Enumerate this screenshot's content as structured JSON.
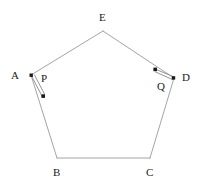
{
  "figure": {
    "type": "geometry-diagram",
    "shape_name": "pentagon",
    "canvas": {
      "width": 203,
      "height": 188
    },
    "style": {
      "edge_color": "#9a9a9a",
      "edge_width": 0.9,
      "vector_color": "#5a5a5a",
      "dot_color": "#1a1a1a",
      "label_color": "#1a1a1a",
      "background": "#ffffff"
    },
    "vertices": [
      {
        "id": "A",
        "label": "A",
        "x": 31,
        "y": 75,
        "label_x": 11,
        "label_y": 70,
        "has_dot": true
      },
      {
        "id": "B",
        "label": "B",
        "x": 57,
        "y": 158,
        "label_x": 53,
        "label_y": 167,
        "has_dot": false
      },
      {
        "id": "C",
        "label": "C",
        "x": 150,
        "y": 158,
        "label_x": 146,
        "label_y": 167,
        "has_dot": false
      },
      {
        "id": "D",
        "label": "D",
        "x": 174,
        "y": 78,
        "label_x": 182,
        "label_y": 72,
        "has_dot": true
      },
      {
        "id": "E",
        "label": "E",
        "x": 103,
        "y": 31,
        "label_x": 99,
        "label_y": 12,
        "has_dot": false
      }
    ],
    "edges": [
      {
        "from": "A",
        "to": "E"
      },
      {
        "from": "E",
        "to": "D"
      },
      {
        "from": "D",
        "to": "C"
      },
      {
        "from": "C",
        "to": "B"
      },
      {
        "from": "B",
        "to": "A"
      }
    ],
    "vectors": [
      {
        "id": "P",
        "label": "P",
        "from_x": 31,
        "from_y": 75,
        "to_x": 43,
        "to_y": 97,
        "label_x": 41,
        "label_y": 73,
        "tail_dot": true,
        "head_dot": true
      },
      {
        "id": "Q",
        "label": "Q",
        "from_x": 174,
        "from_y": 78,
        "to_x": 154,
        "to_y": 69,
        "label_x": 157,
        "label_y": 81,
        "tail_dot": true,
        "head_dot": true
      }
    ]
  }
}
